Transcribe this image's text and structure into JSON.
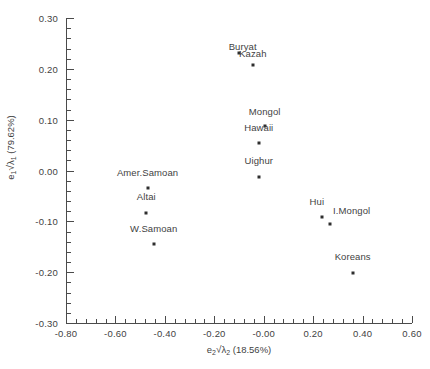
{
  "chart_data": {
    "type": "scatter",
    "title": "",
    "xlabel": "e2*sqrt(lambda2) (18.56%)",
    "ylabel": "e1*sqrt(lambda1) (79.62%)",
    "xlabel_parts": {
      "base": "e",
      "sub1": "2",
      "radical": "√",
      "lam": "λ",
      "sub2": "2",
      "percent": "(18.56%)"
    },
    "ylabel_parts": {
      "base": "e",
      "sub1": "1",
      "radical": "√",
      "lam": "λ",
      "sub2": "1",
      "percent": "(79.62%)"
    },
    "xlim": [
      -0.8,
      0.6
    ],
    "ylim": [
      -0.3,
      0.3
    ],
    "xticks": [
      "-0.80",
      "-0.60",
      "-0.40",
      "-0.20",
      "-0.00",
      "0.20",
      "0.40",
      "0.60"
    ],
    "xtick_values": [
      -0.8,
      -0.6,
      -0.4,
      -0.2,
      0.0,
      0.2,
      0.4,
      0.6
    ],
    "yticks": [
      "0.30",
      "0.20",
      "0.10",
      "0.00",
      "-0.10",
      "-0.20",
      "-0.30"
    ],
    "ytick_values": [
      0.3,
      0.2,
      0.1,
      0.0,
      -0.1,
      -0.2,
      -0.3
    ],
    "minor_ticks_per_interval": 5,
    "grid": false,
    "legend": null,
    "points": [
      {
        "label": "Buryat",
        "x": -0.045,
        "y": 0.207,
        "label_dx": -0.04,
        "label_dy": 0.038
      },
      {
        "label": "Kazah",
        "x": -0.102,
        "y": 0.231,
        "label_dx": 0.058,
        "label_dy": 0.0
      },
      {
        "label": "Mongol",
        "x": 0.004,
        "y": 0.088,
        "label_dx": 0.0,
        "label_dy": 0.03
      },
      {
        "label": "Hawaii",
        "x": -0.02,
        "y": 0.055,
        "label_dx": 0.0,
        "label_dy": 0.03
      },
      {
        "label": "Uighur",
        "x": -0.02,
        "y": -0.012,
        "label_dx": 0.0,
        "label_dy": 0.032
      },
      {
        "label": "Amer.Samoan",
        "x": -0.47,
        "y": -0.035,
        "label_dx": 0.0,
        "label_dy": 0.032
      },
      {
        "label": "Altai",
        "x": -0.475,
        "y": -0.083,
        "label_dx": 0.0,
        "label_dy": 0.032
      },
      {
        "label": "W.Samoan",
        "x": -0.445,
        "y": -0.145,
        "label_dx": 0.0,
        "label_dy": 0.032
      },
      {
        "label": "Hui",
        "x": 0.235,
        "y": -0.092,
        "label_dx": -0.02,
        "label_dy": 0.032
      },
      {
        "label": "I.Mongol",
        "x": 0.268,
        "y": -0.106,
        "label_dx": 0.088,
        "label_dy": 0.028
      },
      {
        "label": "Koreans",
        "x": 0.36,
        "y": -0.201,
        "label_dx": 0.0,
        "label_dy": 0.032
      }
    ]
  }
}
